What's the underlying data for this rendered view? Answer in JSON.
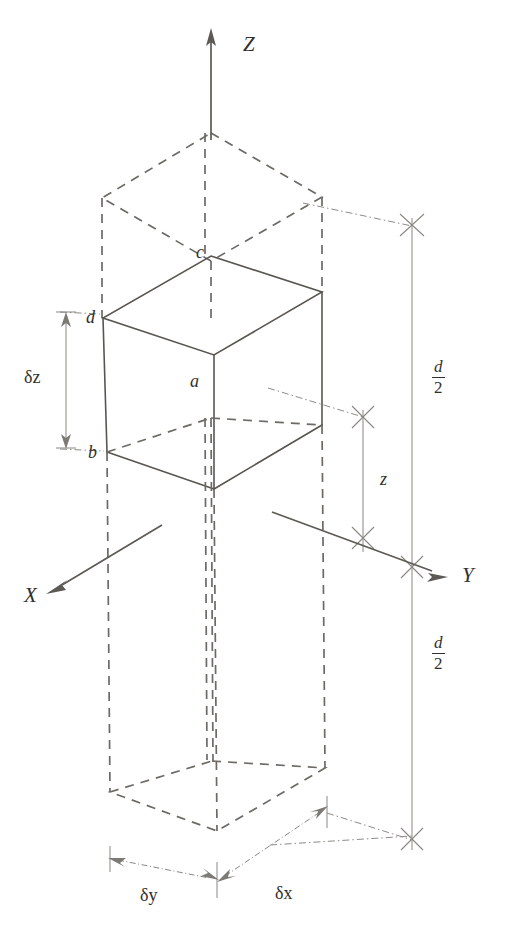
{
  "figure": {
    "background_color": "#ffffff",
    "stroke_color": "#595651",
    "dashed_color": "#6d6a66",
    "thin_color": "#8a8782",
    "text_color": "#332f2c"
  },
  "axes": [
    {
      "id": "z",
      "label": "Z",
      "direction": "up",
      "label_x": 243,
      "label_y": 34
    },
    {
      "id": "y",
      "label": "Y",
      "direction": "down-right",
      "label_x": 462,
      "label_y": 565
    },
    {
      "id": "x",
      "label": "X",
      "direction": "down-left",
      "label_x": 24,
      "label_y": 585
    }
  ],
  "vertices": [
    {
      "id": "a",
      "label": "a",
      "x": 190,
      "y": 372
    },
    {
      "id": "b",
      "label": "b",
      "x": 88,
      "y": 443
    },
    {
      "id": "c",
      "label": "c",
      "x": 196,
      "y": 243
    },
    {
      "id": "d",
      "label": "d",
      "x": 86,
      "y": 308
    }
  ],
  "dimensions": [
    {
      "id": "delta-z",
      "label": "δz",
      "symbol": "δ",
      "variable": "z",
      "orientation": "vertical",
      "label_x": 24,
      "label_y": 368
    },
    {
      "id": "delta-y",
      "label": "δy",
      "symbol": "δ",
      "variable": "y",
      "orientation": "horizontal",
      "label_x": 140,
      "label_y": 886
    },
    {
      "id": "delta-x",
      "label": "δx",
      "symbol": "δ",
      "variable": "x",
      "orientation": "diagonal",
      "label_x": 275,
      "label_y": 884
    },
    {
      "id": "depth-z",
      "label": "z",
      "orientation": "vertical",
      "label_x": 380,
      "label_y": 470
    }
  ],
  "fractions": [
    {
      "id": "half-depth-upper",
      "numerator": "d",
      "denominator": "2",
      "label_x": 432,
      "label_y": 358
    },
    {
      "id": "half-depth-lower",
      "numerator": "d",
      "denominator": "2",
      "label_x": 432,
      "label_y": 634
    }
  ],
  "geometry": {
    "note": "Isometric projection; solid hexahedron is the control volume, dashed prisms above and below indicate the full layer of depth d."
  }
}
